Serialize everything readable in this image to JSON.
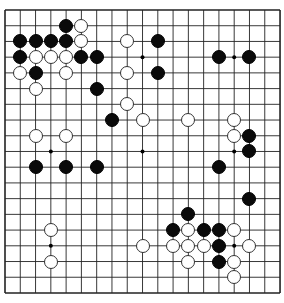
{
  "board": {
    "size": 19,
    "origin_x": 5,
    "origin_y": 10,
    "spacing_x": 15.28,
    "spacing_y": 15.72,
    "line_color": "#222222",
    "background": "#ffffff",
    "star_points": [
      [
        3,
        3
      ],
      [
        9,
        3
      ],
      [
        15,
        3
      ],
      [
        3,
        9
      ],
      [
        9,
        9
      ],
      [
        15,
        9
      ],
      [
        3,
        15
      ],
      [
        9,
        15
      ],
      [
        15,
        15
      ]
    ]
  },
  "stones": {
    "black": [
      [
        4,
        1
      ],
      [
        1,
        2
      ],
      [
        2,
        2
      ],
      [
        3,
        2
      ],
      [
        4,
        2
      ],
      [
        10,
        2
      ],
      [
        1,
        3
      ],
      [
        5,
        3
      ],
      [
        6,
        3
      ],
      [
        14,
        3
      ],
      [
        16,
        3
      ],
      [
        2,
        4
      ],
      [
        10,
        4
      ],
      [
        6,
        5
      ],
      [
        7,
        7
      ],
      [
        16,
        8
      ],
      [
        16,
        9
      ],
      [
        2,
        10
      ],
      [
        4,
        10
      ],
      [
        6,
        10
      ],
      [
        14,
        10
      ],
      [
        16,
        12
      ],
      [
        12,
        13
      ],
      [
        11,
        14
      ],
      [
        13,
        14
      ],
      [
        14,
        14
      ],
      [
        14,
        15
      ],
      [
        14,
        16
      ]
    ],
    "white": [
      [
        5,
        1
      ],
      [
        5,
        2
      ],
      [
        8,
        2
      ],
      [
        2,
        3
      ],
      [
        3,
        3
      ],
      [
        4,
        3
      ],
      [
        1,
        4
      ],
      [
        4,
        4
      ],
      [
        8,
        4
      ],
      [
        2,
        5
      ],
      [
        8,
        6
      ],
      [
        9,
        7
      ],
      [
        12,
        7
      ],
      [
        15,
        7
      ],
      [
        2,
        8
      ],
      [
        4,
        8
      ],
      [
        15,
        8
      ],
      [
        3,
        14
      ],
      [
        12,
        14
      ],
      [
        15,
        14
      ],
      [
        9,
        15
      ],
      [
        11,
        15
      ],
      [
        12,
        15
      ],
      [
        13,
        15
      ],
      [
        16,
        15
      ],
      [
        3,
        16
      ],
      [
        12,
        16
      ],
      [
        15,
        16
      ],
      [
        15,
        17
      ]
    ]
  }
}
